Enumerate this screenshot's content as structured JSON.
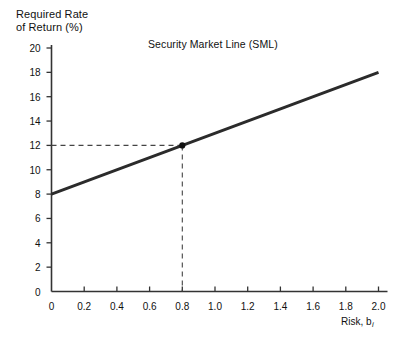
{
  "chart_data": {
    "type": "line",
    "title": "Security Market Line (SML)",
    "xlabel": "Risk, b",
    "xlabel_subscript": "i",
    "ylabel_line1": "Required Rate",
    "ylabel_line2": "of Return (%)",
    "xlim": [
      0,
      2.0
    ],
    "ylim": [
      0,
      20
    ],
    "grid": false,
    "legend": "none",
    "x_tick_labels": [
      "0",
      "0.2",
      "0.4",
      "0.6",
      "0.8",
      "1.0",
      "1.2",
      "1.4",
      "1.6",
      "1.8",
      "2.0"
    ],
    "x_tick_values": [
      0,
      0.2,
      0.4,
      0.6,
      0.8,
      1.0,
      1.2,
      1.4,
      1.6,
      1.8,
      2.0
    ],
    "y_tick_labels": [
      "20",
      "18",
      "16",
      "14",
      "12",
      "10",
      "8",
      "6",
      "4",
      "2",
      "0"
    ],
    "y_tick_values": [
      20,
      18,
      16,
      14,
      12,
      10,
      8,
      6,
      4,
      2,
      0
    ],
    "series": [
      {
        "name": "Security Market Line (SML)",
        "x": [
          0,
          2.0
        ],
        "values": [
          8,
          18
        ],
        "color": "#2b2b2b",
        "line_width": 3
      }
    ],
    "annotations": [
      {
        "name": "marked-point",
        "x": 0.8,
        "y": 12,
        "marker": "filled-circle",
        "color": "#111111",
        "dashed_guide_x": true,
        "dashed_guide_y": true
      }
    ],
    "axis_color": "#333333",
    "background": "#ffffff"
  },
  "axes": {
    "y_tick_direction": "outward",
    "x_tick_direction": "inward"
  }
}
